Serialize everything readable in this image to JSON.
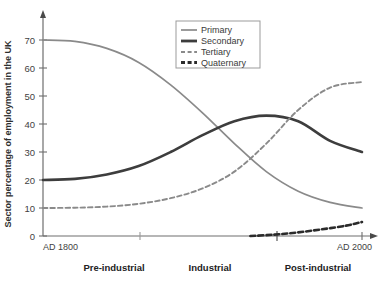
{
  "chart_data": {
    "type": "line",
    "title": "",
    "subtitle": "",
    "ylabel": "Sector percentage of employment in the UK",
    "xlabel": "",
    "ylim": [
      0,
      74
    ],
    "yticks": [
      0,
      10,
      20,
      30,
      40,
      50,
      60,
      70
    ],
    "ytick_labels": [
      "0",
      "10",
      "20",
      "30",
      "40",
      "50",
      "60",
      "70"
    ],
    "grid": false,
    "legend_position": "top-right",
    "x_axis": {
      "start_label": "AD 1800",
      "end_label": "AD 2000",
      "xlim": [
        1800,
        2000
      ],
      "tick_years": [
        1800,
        1860,
        1930,
        1970,
        2000
      ],
      "region_labels": [
        "Pre-industrial",
        "Industrial",
        "Post-industrial"
      ]
    },
    "series": [
      {
        "name": "Primary",
        "color": "#8a8a8a",
        "style": "solid",
        "width": 1.7,
        "x": [
          1800,
          1820,
          1840,
          1860,
          1880,
          1900,
          1920,
          1940,
          1960,
          1980,
          2000
        ],
        "values": [
          70,
          69.5,
          67,
          62,
          54,
          44,
          33,
          23,
          16,
          12,
          10
        ]
      },
      {
        "name": "Secondary",
        "color": "#3d3d3d",
        "style": "solid",
        "width": 2.6,
        "x": [
          1800,
          1820,
          1840,
          1860,
          1880,
          1900,
          1920,
          1940,
          1960,
          1980,
          2000
        ],
        "values": [
          20,
          20.4,
          22,
          25,
          30,
          36,
          41,
          43,
          41,
          34,
          30
        ]
      },
      {
        "name": "Tertiary",
        "color": "#8a8a8a",
        "style": "dashed",
        "width": 1.9,
        "x": [
          1800,
          1820,
          1840,
          1860,
          1880,
          1900,
          1920,
          1940,
          1960,
          1980,
          2000
        ],
        "values": [
          10,
          10.1,
          10.5,
          11.5,
          13.5,
          17,
          23,
          33,
          45,
          53,
          55
        ]
      },
      {
        "name": "Quaternary",
        "color": "#2b2b2b",
        "style": "dashed",
        "width": 2.6,
        "x": [
          1930,
          1945,
          1960,
          1975,
          1990,
          2000
        ],
        "values": [
          0,
          0.5,
          1.3,
          2.4,
          3.7,
          5
        ]
      }
    ]
  },
  "legend": {
    "items": [
      {
        "label": "Primary"
      },
      {
        "label": "Secondary"
      },
      {
        "label": "Tertiary"
      },
      {
        "label": "Quaternary"
      }
    ]
  },
  "caption": ""
}
